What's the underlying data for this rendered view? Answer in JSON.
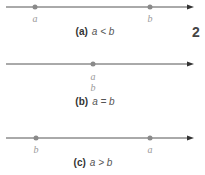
{
  "panels": [
    {
      "tag": "(a)",
      "relation": "a < b",
      "points": [
        {
          "label": "a"
        },
        {
          "label": "b"
        }
      ]
    },
    {
      "tag": "(b)",
      "relation": "a = b",
      "points": [
        {
          "label": "a"
        },
        {
          "label": "b"
        }
      ]
    },
    {
      "tag": "(c)",
      "relation": "a > b",
      "points": [
        {
          "label": "b"
        },
        {
          "label": "a"
        }
      ]
    }
  ],
  "side_text": "2",
  "colors": {
    "line": "#555555",
    "point": "#8a8a8a",
    "label": "#9a9a9a"
  }
}
